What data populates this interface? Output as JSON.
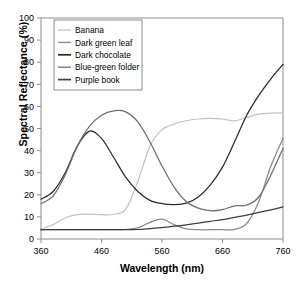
{
  "chart_data": {
    "type": "line",
    "title": "",
    "xlabel": "Wavelength (nm)",
    "ylabel": "Spectral Reflectance (%)",
    "xlim": [
      360,
      760
    ],
    "ylim": [
      0,
      100
    ],
    "xticks": [
      360,
      460,
      560,
      660,
      760
    ],
    "yticks": [
      0,
      10,
      20,
      30,
      40,
      50,
      60,
      70,
      80,
      90,
      100
    ],
    "grid": false,
    "legend_position": "top-left",
    "x": [
      360,
      380,
      400,
      420,
      440,
      460,
      480,
      500,
      520,
      540,
      560,
      580,
      600,
      620,
      640,
      660,
      680,
      700,
      720,
      740,
      760
    ],
    "series": [
      {
        "name": "Banana",
        "color": "#c2c2c2",
        "values": [
          4.5,
          6.5,
          9.5,
          11.0,
          11.2,
          11.0,
          11.2,
          13.5,
          26.0,
          42.0,
          49.5,
          52.0,
          53.5,
          54.3,
          54.6,
          54.3,
          53.5,
          55.0,
          56.5,
          57.0,
          57.0
        ]
      },
      {
        "name": "Dark green leaf",
        "color": "#8a8a8a",
        "values": [
          4.2,
          4.2,
          4.2,
          4.2,
          4.2,
          4.2,
          4.2,
          4.3,
          5.0,
          7.5,
          9.0,
          6.5,
          4.6,
          4.2,
          4.2,
          4.2,
          4.4,
          7.0,
          17.0,
          33.0,
          45.5
        ]
      },
      {
        "name": "Dark chocolate",
        "color": "#2b2b2b",
        "values": [
          18.0,
          21.5,
          30.0,
          42.0,
          48.8,
          45.5,
          37.0,
          28.0,
          21.5,
          17.5,
          16.0,
          15.6,
          16.2,
          19.0,
          24.5,
          32.5,
          44.0,
          56.0,
          65.0,
          72.5,
          79.0
        ]
      },
      {
        "name": "Blue-green folder",
        "color": "#6e6e6e",
        "values": [
          16.0,
          19.5,
          29.0,
          42.0,
          51.0,
          56.0,
          58.0,
          57.5,
          53.0,
          44.0,
          33.0,
          23.5,
          17.0,
          14.0,
          12.8,
          13.3,
          15.0,
          15.3,
          19.0,
          29.0,
          41.0
        ]
      },
      {
        "name": "Purple book",
        "color": "#3d3d3d",
        "values": [
          4.2,
          4.2,
          4.2,
          4.2,
          4.2,
          4.2,
          4.2,
          4.2,
          4.3,
          4.7,
          5.2,
          5.8,
          6.4,
          7.2,
          8.0,
          8.8,
          9.8,
          10.8,
          12.0,
          13.2,
          14.5
        ]
      }
    ]
  }
}
